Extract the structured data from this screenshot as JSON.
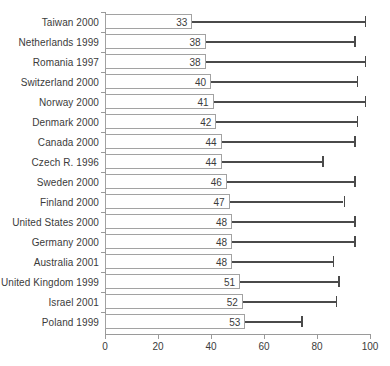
{
  "chart_data": {
    "type": "bar",
    "title": "",
    "subtitle": "",
    "xlabel": "",
    "ylabel": "",
    "xlim": [
      0,
      100
    ],
    "xticks": [
      0,
      20,
      40,
      60,
      80,
      100
    ],
    "grid": false,
    "legend": null,
    "orientation": "horizontal",
    "categories": [
      "Taiwan 2000",
      "Netherlands 1999",
      "Romania 1997",
      "Switzerland 2000",
      "Norway 2000",
      "Denmark 2000",
      "Canada 2000",
      "Czech R. 1996",
      "Sweden 2000",
      "Finland 2000",
      "United States 2000",
      "Germany 2000",
      "Australia 2001",
      "United Kingdom 1999",
      "Israel 2001",
      "Poland 1999"
    ],
    "values": [
      33,
      38,
      38,
      40,
      41,
      42,
      44,
      44,
      46,
      47,
      48,
      48,
      48,
      51,
      52,
      53
    ],
    "value_labels": [
      "33",
      "38",
      "38",
      "40",
      "41",
      "42",
      "44",
      "44",
      "46",
      "47",
      "48",
      "48",
      "48",
      "51",
      "52",
      "53"
    ],
    "whisker_ends": [
      98,
      94,
      98,
      95,
      98,
      95,
      94,
      82,
      94,
      90,
      94,
      94,
      86,
      88,
      87,
      74
    ],
    "series": [
      {
        "name": "value",
        "values": [
          33,
          38,
          38,
          40,
          41,
          42,
          44,
          44,
          46,
          47,
          48,
          48,
          48,
          51,
          52,
          53
        ]
      },
      {
        "name": "upper-extent",
        "values": [
          98,
          94,
          98,
          95,
          98,
          95,
          94,
          82,
          94,
          90,
          94,
          94,
          86,
          88,
          87,
          74
        ]
      }
    ],
    "colors": {
      "bar_fill": "#ffffff",
      "bar_stroke": "#a2a2a2",
      "whisker": "#4a4a4a",
      "axis": "#9a9a9a",
      "text": "#3b3b3b"
    }
  },
  "axis": {
    "tick_labels": [
      "0",
      "20",
      "40",
      "60",
      "80",
      "100"
    ]
  }
}
